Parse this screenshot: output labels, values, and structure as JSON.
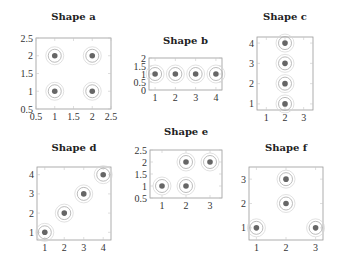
{
  "chart_data": [
    {
      "id": "a",
      "type": "scatter",
      "title": "Shape a",
      "xlabel": "",
      "ylabel": "",
      "xlim": [
        0.5,
        2.5
      ],
      "ylim": [
        0.5,
        2.5
      ],
      "xticks": [
        "0.5",
        "1",
        "1.5",
        "2",
        "2.5"
      ],
      "yticks": [
        "0.5",
        "1",
        "1.5",
        "2",
        "2.5"
      ],
      "points": [
        [
          1,
          1
        ],
        [
          2,
          1
        ],
        [
          1,
          2
        ],
        [
          2,
          2
        ]
      ],
      "marker": "dot with concentric circles"
    },
    {
      "id": "b",
      "type": "scatter",
      "title": "Shape b",
      "xlabel": "",
      "ylabel": "",
      "xlim": [
        0.7,
        4.3
      ],
      "ylim": [
        0,
        2
      ],
      "xticks": [
        "1",
        "2",
        "3",
        "4"
      ],
      "yticks": [
        "0",
        "0.5",
        "1",
        "1.5",
        "2"
      ],
      "points": [
        [
          1,
          1
        ],
        [
          2,
          1
        ],
        [
          3,
          1
        ],
        [
          4,
          1
        ]
      ],
      "marker": "dot with concentric circles"
    },
    {
      "id": "c",
      "type": "scatter",
      "title": "Shape c",
      "xlabel": "",
      "ylabel": "",
      "xlim": [
        0.5,
        3.5
      ],
      "ylim": [
        0.7,
        4.3
      ],
      "xticks": [
        "1",
        "2",
        "3"
      ],
      "yticks": [
        "1",
        "2",
        "3",
        "4"
      ],
      "points": [
        [
          2,
          1
        ],
        [
          2,
          2
        ],
        [
          2,
          3
        ],
        [
          2,
          4
        ]
      ],
      "marker": "dot with concentric circles"
    },
    {
      "id": "d",
      "type": "scatter",
      "title": "Shape d",
      "xlabel": "",
      "ylabel": "",
      "xlim": [
        0.6,
        4.4
      ],
      "ylim": [
        0.6,
        4.4
      ],
      "xticks": [
        "1",
        "2",
        "3",
        "4"
      ],
      "yticks": [
        "1",
        "2",
        "3",
        "4"
      ],
      "points": [
        [
          1,
          1
        ],
        [
          2,
          2
        ],
        [
          3,
          3
        ],
        [
          4,
          4
        ]
      ],
      "marker": "dot with concentric circles"
    },
    {
      "id": "e",
      "type": "scatter",
      "title": "Shape e",
      "xlabel": "",
      "ylabel": "",
      "xlim": [
        0.5,
        3.5
      ],
      "ylim": [
        0.5,
        2.5
      ],
      "xticks": [
        "1",
        "2",
        "3"
      ],
      "yticks": [
        "0.5",
        "1",
        "1.5",
        "2",
        "2.5"
      ],
      "points": [
        [
          1,
          1
        ],
        [
          2,
          1
        ],
        [
          2,
          2
        ],
        [
          3,
          2
        ]
      ],
      "marker": "dot with concentric circles"
    },
    {
      "id": "f",
      "type": "scatter",
      "title": "Shape f",
      "xlabel": "",
      "ylabel": "",
      "xlim": [
        0.75,
        3.25
      ],
      "ylim": [
        0.5,
        3.5
      ],
      "xticks": [
        "1",
        "2",
        "3"
      ],
      "yticks": [
        "1",
        "2",
        "3"
      ],
      "points": [
        [
          1,
          1
        ],
        [
          3,
          1
        ],
        [
          2,
          2
        ],
        [
          2,
          3
        ]
      ],
      "marker": "dot with concentric circles"
    }
  ]
}
